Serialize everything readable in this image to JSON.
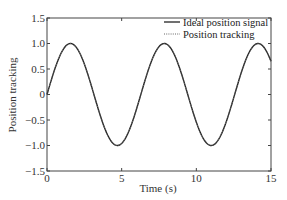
{
  "chart_data": {
    "type": "line",
    "title": "",
    "xlabel": "Time (s)",
    "ylabel": "Position tracking",
    "xlim": [
      0,
      15
    ],
    "ylim": [
      -1.5,
      1.5
    ],
    "xticks": [
      0,
      5,
      10,
      15
    ],
    "xtick_labels": [
      "0",
      "5",
      "10",
      "15"
    ],
    "yticks": [
      -1.5,
      -1.0,
      -0.5,
      0,
      0.5,
      1.0,
      1.5
    ],
    "ytick_labels": [
      "-1.5",
      "-1.0",
      "-0.5",
      "0",
      "0.5",
      "1.0",
      "1.5"
    ],
    "grid": false,
    "legend_position": "upper right",
    "series": [
      {
        "name": "Ideal position signal",
        "style": "solid",
        "function": "sin(t)",
        "x": [
          0,
          1.57,
          3.14,
          4.71,
          6.28,
          7.85,
          9.42,
          11.0,
          12.57,
          14.14,
          15
        ],
        "values": [
          0,
          1.0,
          0,
          -1.0,
          0,
          1.0,
          0,
          -1.0,
          0,
          1.0,
          0.65
        ]
      },
      {
        "name": "Position tracking",
        "style": "dotted",
        "function": "sin(t)",
        "x": [
          0,
          1.57,
          3.14,
          4.71,
          6.28,
          7.85,
          9.42,
          11.0,
          12.57,
          14.14,
          15
        ],
        "values": [
          0,
          1.0,
          0,
          -1.0,
          0,
          1.0,
          0,
          -1.0,
          0,
          1.0,
          0.65
        ]
      }
    ]
  }
}
